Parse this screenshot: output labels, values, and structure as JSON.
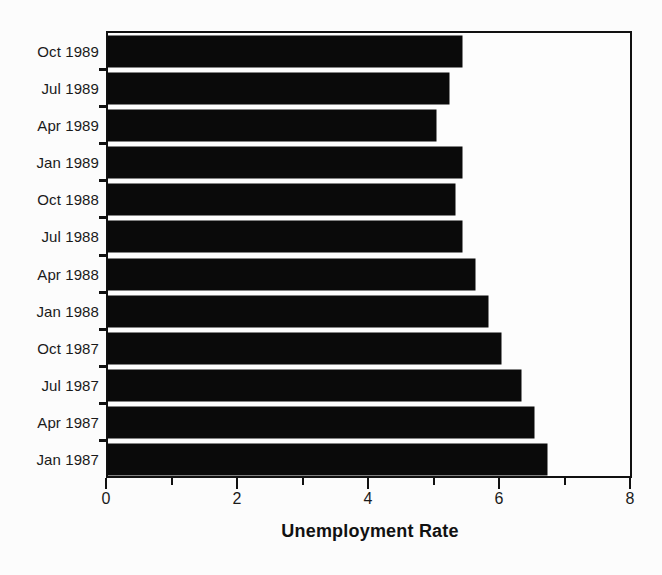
{
  "chart_data": {
    "type": "bar",
    "orientation": "horizontal",
    "title": "",
    "xlabel": "Unemployment Rate",
    "ylabel": "",
    "xlim": [
      0,
      8
    ],
    "x_major_ticks": [
      0,
      2,
      4,
      6,
      8
    ],
    "x_minor_ticks": [
      1,
      3,
      5,
      7
    ],
    "x_tick_labels": [
      "0",
      "2",
      "4",
      "6",
      "8"
    ],
    "grid": false,
    "legend": false,
    "bar_color": "#0a0a0a",
    "background_color": "#fcfcfc",
    "frame_color": "#111111",
    "categories": [
      "Oct 1989",
      "Jul 1989",
      "Apr 1989",
      "Jan 1989",
      "Oct 1988",
      "Jul 1988",
      "Apr 1988",
      "Jan 1988",
      "Oct 1987",
      "Jul 1987",
      "Apr 1987",
      "Jan 1987"
    ],
    "values": [
      5.4,
      5.2,
      5.0,
      5.4,
      5.3,
      5.4,
      5.6,
      5.8,
      6.0,
      6.3,
      6.5,
      6.7
    ],
    "series": [
      {
        "name": "Unemployment Rate",
        "values": [
          5.4,
          5.2,
          5.0,
          5.4,
          5.3,
          5.4,
          5.6,
          5.8,
          6.0,
          6.3,
          6.5,
          6.7
        ]
      }
    ]
  }
}
